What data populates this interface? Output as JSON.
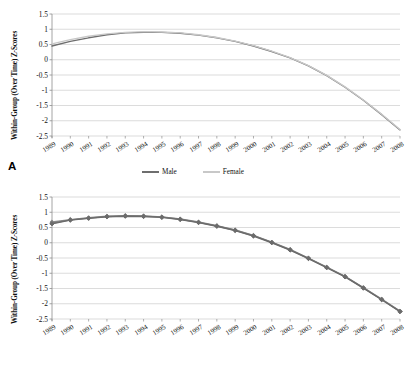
{
  "figure": {
    "panels": [
      {
        "id": "A",
        "label": "A",
        "ylabel": "Within-Group (Over Time) Z-Scores"
      },
      {
        "id": "B",
        "label": "B",
        "ylabel": "Within-Group (Over Time) Z-Scores"
      }
    ]
  },
  "chart_data": [
    {
      "type": "line",
      "panel": "A",
      "title": "",
      "xlabel": "",
      "ylabel": "Within-Group (Over Time) Z-Scores",
      "ylim": [
        -2.5,
        1.5
      ],
      "yticks": [
        1.5,
        1,
        0.5,
        0,
        -0.5,
        -1,
        -1.5,
        -2,
        -2.5
      ],
      "ytick_labels": [
        "1.5",
        "1",
        "0.5",
        "0",
        "-0.5",
        "-1",
        "-1.5",
        "-2",
        "-2.5"
      ],
      "grid": true,
      "legend_position": "bottom",
      "categories": [
        "1989",
        "1990",
        "1991",
        "1992",
        "1993",
        "1994",
        "1995",
        "1996",
        "1997",
        "1998",
        "1999",
        "2000",
        "2001",
        "2002",
        "2003",
        "2004",
        "2005",
        "2006",
        "2007",
        "2008"
      ],
      "series": [
        {
          "name": "Male",
          "color": "#6e6e6e",
          "marker": "none",
          "values": [
            0.45,
            0.6,
            0.72,
            0.82,
            0.88,
            0.9,
            0.9,
            0.87,
            0.81,
            0.72,
            0.6,
            0.45,
            0.27,
            0.06,
            -0.2,
            -0.52,
            -0.9,
            -1.33,
            -1.8,
            -2.3
          ]
        },
        {
          "name": "Female",
          "color": "#c8c8c8",
          "marker": "none",
          "values": [
            0.52,
            0.66,
            0.77,
            0.85,
            0.9,
            0.92,
            0.91,
            0.88,
            0.82,
            0.73,
            0.61,
            0.46,
            0.28,
            0.07,
            -0.19,
            -0.51,
            -0.89,
            -1.32,
            -1.79,
            -2.29
          ]
        }
      ]
    },
    {
      "type": "line",
      "panel": "B",
      "title": "",
      "xlabel": "",
      "ylabel": "Within-Group (Over Time) Z-Scores",
      "ylim": [
        -2.5,
        1.5
      ],
      "yticks": [
        1.5,
        1,
        0.5,
        0,
        -0.5,
        -1,
        -1.5,
        -2,
        -2.5
      ],
      "ytick_labels": [
        "1.5",
        "1",
        "0.5",
        "0",
        "-0.5",
        "-1",
        "-1.5",
        "-2",
        "-2.5"
      ],
      "grid": true,
      "legend_position": "bottom",
      "categories": [
        "1989",
        "1990",
        "1991",
        "1992",
        "1993",
        "1994",
        "1995",
        "1996",
        "1997",
        "1998",
        "1999",
        "2000",
        "2001",
        "2002",
        "2003",
        "2004",
        "2005",
        "2006",
        "2007",
        "2008"
      ],
      "series": [
        {
          "name": "15 to 29",
          "color": "#8a8a8a",
          "marker": "diamond",
          "values": [
            0.68,
            0.76,
            0.82,
            0.87,
            0.89,
            0.88,
            0.85,
            0.78,
            0.68,
            0.56,
            0.42,
            0.24,
            0.02,
            -0.22,
            -0.5,
            -0.8,
            -1.1,
            -1.47,
            -1.85,
            -2.24
          ]
        },
        {
          "name": "30 to 44",
          "color": "#7a7a7a",
          "marker": "diamond",
          "values": [
            0.64,
            0.75,
            0.81,
            0.86,
            0.88,
            0.87,
            0.84,
            0.77,
            0.67,
            0.55,
            0.41,
            0.23,
            0.01,
            -0.23,
            -0.51,
            -0.81,
            -1.11,
            -1.48,
            -1.86,
            -2.25
          ]
        },
        {
          "name": "45 to 59",
          "color": "#6b6b6b",
          "marker": "diamond",
          "values": [
            0.62,
            0.74,
            0.8,
            0.85,
            0.87,
            0.86,
            0.83,
            0.76,
            0.66,
            0.54,
            0.4,
            0.22,
            0.0,
            -0.24,
            -0.52,
            -0.82,
            -1.12,
            -1.49,
            -1.87,
            -2.26
          ]
        }
      ]
    }
  ]
}
